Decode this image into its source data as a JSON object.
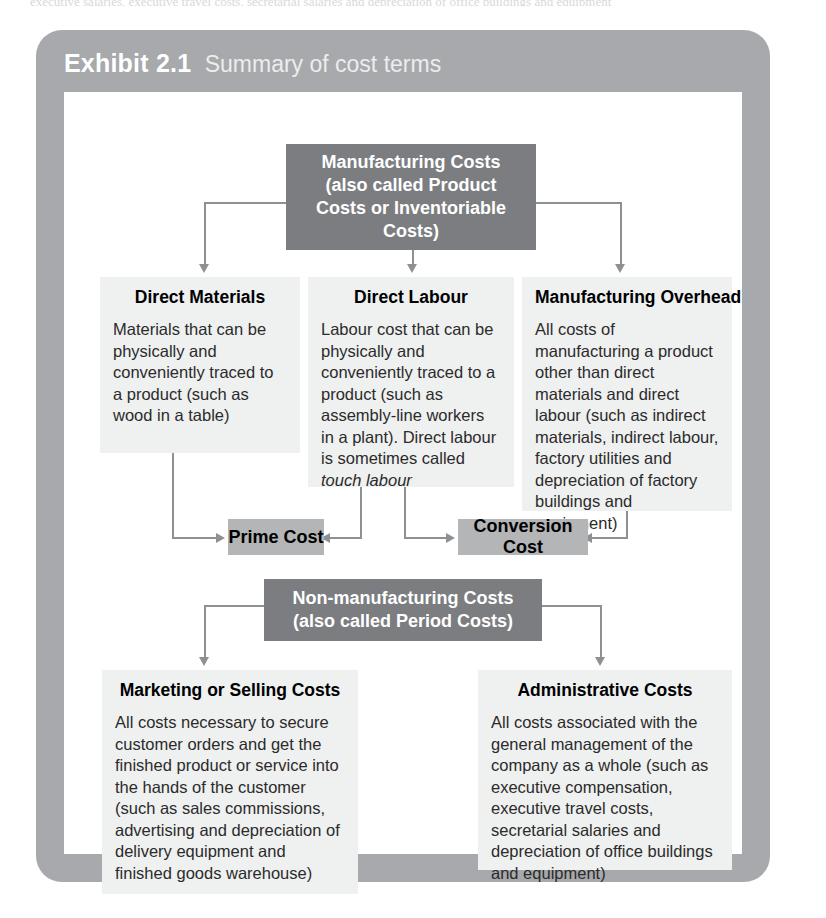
{
  "page": {
    "top_text_sliver": "executive salaries, executive travel costs, secretarial salaries and depreciation of office buildings and equipment"
  },
  "exhibit": {
    "number_label": "Exhibit 2.1",
    "subtitle": "Summary of cost terms"
  },
  "colors": {
    "frame": "#a7a9ac",
    "canvas": "#ffffff",
    "node_dark": "#7b7d80",
    "node_mid": "#b3b5b7",
    "node_light": "#eff0f0",
    "connector": "#8e9194"
  },
  "nodes": {
    "manufacturing_costs": {
      "title": "Manufacturing Costs (also called Product Costs or Inventoriable Costs)",
      "line1": "Manufacturing Costs",
      "line2": "(also called Product",
      "line3": "Costs or Inventoriable",
      "line4": "Costs)"
    },
    "direct_materials": {
      "title": "Direct Materials",
      "body": "Materials that can be physically and conveniently traced to a product (such as wood in a table)"
    },
    "direct_labour": {
      "title": "Direct Labour",
      "body": "Labour cost that can be physically and conveniently traced to a product (such as assembly-line workers in a plant). Direct labour is sometimes called ",
      "body_italic": "touch labour"
    },
    "manufacturing_overhead": {
      "title": "Manufacturing Overhead",
      "body": "All costs of manufacturing a product other than direct materials and direct labour (such as indirect materials, indirect labour, factory utilities and depreciation of factory buildings and equipment)"
    },
    "prime_cost": {
      "title": "Prime Cost"
    },
    "conversion_cost": {
      "title": "Conversion Cost"
    },
    "non_manufacturing_costs": {
      "title": "Non-manufacturing Costs (also called Period Costs)",
      "line1": "Non-manufacturing Costs",
      "line2": "(also called Period Costs)"
    },
    "marketing_selling_costs": {
      "title": "Marketing or Selling Costs",
      "body": "All costs necessary to secure customer orders and get the finished product or service into the hands of the customer (such as sales commissions, advertising and depreciation of delivery equipment and finished goods warehouse)"
    },
    "administrative_costs": {
      "title": "Administrative Costs",
      "body": "All costs associated with the general management of the company as a whole (such as executive compensation, executive travel costs, secretarial salaries and depreciation of office buildings and equipment)"
    }
  }
}
